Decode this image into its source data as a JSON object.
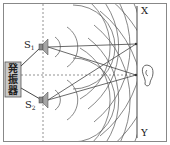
{
  "diagram": {
    "type": "two-source sound interference",
    "labels": {
      "source1": "S",
      "source1_sub": "1",
      "source2": "S",
      "source2_sub": "2",
      "oscillator": [
        "発",
        "振",
        "器"
      ],
      "wall_top": "X",
      "wall_bottom": "Y"
    },
    "colors": {
      "line": "#444444",
      "frame": "#888888",
      "oscillator_fill": "#c8c8c8",
      "speaker_fill": "#9a9a9a",
      "dashed": "#777777"
    },
    "elements": {
      "source1": {
        "x": 43,
        "y": 47
      },
      "source2": {
        "x": 43,
        "y": 100
      },
      "wall_x": 137,
      "meeting_points": [
        {
          "x": 136,
          "y": 44
        },
        {
          "x": 136,
          "y": 75
        }
      ],
      "ear": {
        "x": 146,
        "y": 75
      }
    }
  }
}
